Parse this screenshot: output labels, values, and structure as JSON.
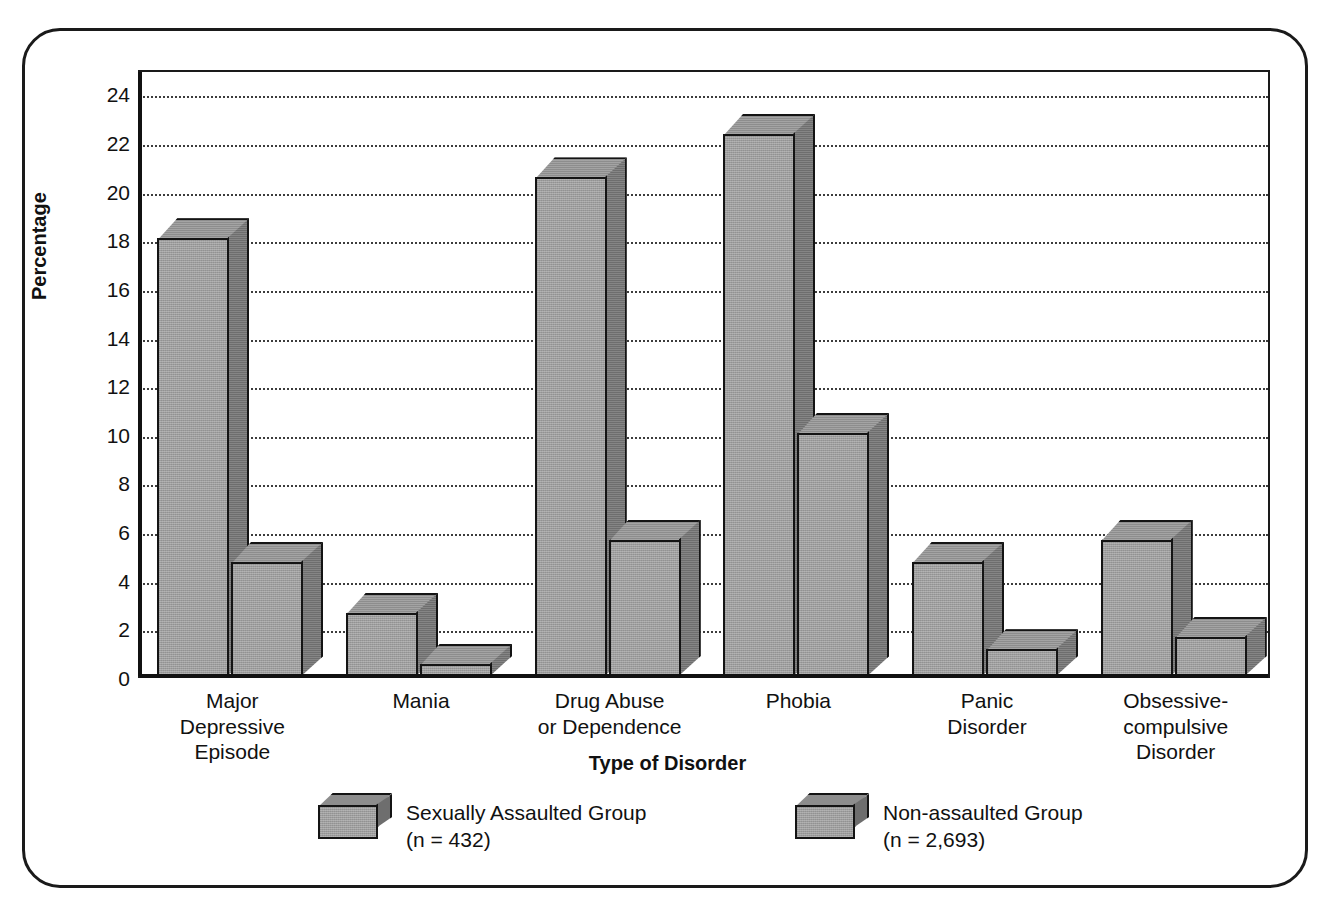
{
  "chart_data": {
    "type": "bar",
    "title": "",
    "xlabel": "Type of Disorder",
    "ylabel": "Percentage",
    "ylim": [
      0,
      25
    ],
    "ytick_step": 2,
    "yticks": [
      24,
      22,
      20,
      18,
      16,
      14,
      12,
      10,
      8,
      6,
      4,
      2,
      0
    ],
    "grid": true,
    "grid_style": "dotted-horizontal",
    "legend_position": "bottom",
    "style_3d": true,
    "categories": [
      "Major\nDepressive\nEpisode",
      "Mania",
      "Drug Abuse\nor Dependence",
      "Phobia",
      "Panic\nDisorder",
      "Obsessive-\ncompulsive\nDisorder"
    ],
    "series": [
      {
        "name": "Sexually Assaulted Group",
        "sublabel": "(n = 432)",
        "color": "#9d9d9d",
        "side_color": "#6e6e6e",
        "top_color": "#8d8d8d",
        "values": [
          18.0,
          2.6,
          20.5,
          22.3,
          4.7,
          5.6
        ]
      },
      {
        "name": "Non-assaulted Group",
        "sublabel": "(n = 2,693)",
        "color": "#9d9d9d",
        "side_color": "#6e6e6e",
        "top_color": "#8d8d8d",
        "values": [
          4.7,
          0.5,
          5.6,
          10.0,
          1.1,
          1.6
        ]
      }
    ]
  },
  "axis": {
    "y_title": "Percentage",
    "x_title": "Type of Disorder"
  },
  "legend": {
    "items": [
      {
        "label": "Sexually Assaulted Group",
        "sublabel": "(n = 432)"
      },
      {
        "label": "Non-assaulted Group",
        "sublabel": "(n = 2,693)"
      }
    ]
  },
  "colors": {
    "bar_front": "#9d9d9d",
    "bar_side": "#6e6e6e",
    "bar_top": "#8d8d8d",
    "axis": "#111111",
    "grid": "#3c3c3c",
    "frame": "#1a1a1a",
    "background": "#ffffff"
  }
}
